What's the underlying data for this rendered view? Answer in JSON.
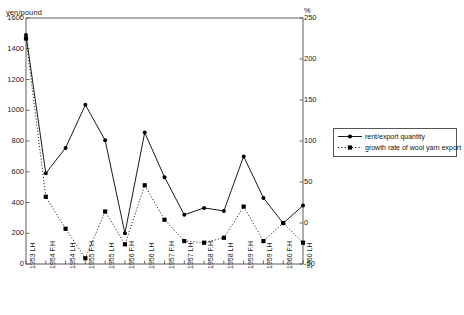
{
  "chart_data": {
    "type": "line",
    "title": "",
    "subtitle": "",
    "xlabel": "",
    "ylabel": "yen/pound",
    "ylabel_right": "%",
    "ylim": [
      0,
      1600
    ],
    "ylim_right": [
      -50,
      250
    ],
    "yticks": [
      0,
      200,
      400,
      600,
      800,
      1000,
      1200,
      1400,
      1600
    ],
    "yticks_right": [
      -50,
      0,
      50,
      100,
      150,
      200,
      250
    ],
    "grid": false,
    "legend_position": "right-middle",
    "categories": [
      "1953 LH",
      "1954 F.H",
      "1954 LH",
      "1955 F.H",
      "1955 LH",
      "1956 F.H",
      "1956 LH",
      "1957 F.H",
      "1957 LH",
      "1958 F.H",
      "1958 LH",
      "1959 F.H",
      "1959 LH",
      "1960 F.H",
      "1960 LH"
    ],
    "series": [
      {
        "name": "rent/export quantity",
        "axis": "left",
        "unit": "yen/pound",
        "marker": "circle",
        "line": "solid",
        "color": "#000000",
        "values": [
          1490,
          590,
          755,
          1035,
          805,
          200,
          855,
          565,
          320,
          365,
          345,
          700,
          430,
          265,
          380
        ]
      },
      {
        "name": "growth rate of wool yarn export",
        "axis": "right",
        "unit": "%",
        "marker": "square",
        "line": "dotted",
        "color": "#000000",
        "values": [
          225,
          32,
          -7,
          -43,
          14,
          -26,
          46,
          4,
          -22,
          -24,
          -18,
          20,
          -22,
          0,
          -24
        ]
      }
    ]
  },
  "legend": {
    "items": [
      {
        "label": "rent/export quantity"
      },
      {
        "label": "growth rate of wool yarn export"
      }
    ]
  },
  "axes": {
    "left_unit": "yen/pound",
    "right_unit": "%"
  }
}
